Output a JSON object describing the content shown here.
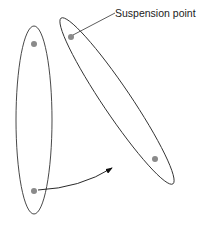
{
  "diagram": {
    "label": "Suspension point",
    "colors": {
      "outline": "#333333",
      "point": "#8a8a8a",
      "background": "#ffffff"
    },
    "shapes": [
      {
        "name": "left-ellipse",
        "cx": 34,
        "cy": 120,
        "rx": 19,
        "ry": 94,
        "rotate": 0
      },
      {
        "name": "right-ellipse",
        "cx": 117,
        "cy": 101,
        "rx": 15,
        "ry": 101,
        "rotate": -34
      }
    ],
    "points": [
      {
        "name": "left-top-point",
        "x": 34,
        "y": 44
      },
      {
        "name": "left-bottom-point",
        "x": 34,
        "y": 191
      },
      {
        "name": "suspension-point",
        "x": 71,
        "y": 37
      },
      {
        "name": "right-bottom-point",
        "x": 155,
        "y": 159
      }
    ]
  }
}
